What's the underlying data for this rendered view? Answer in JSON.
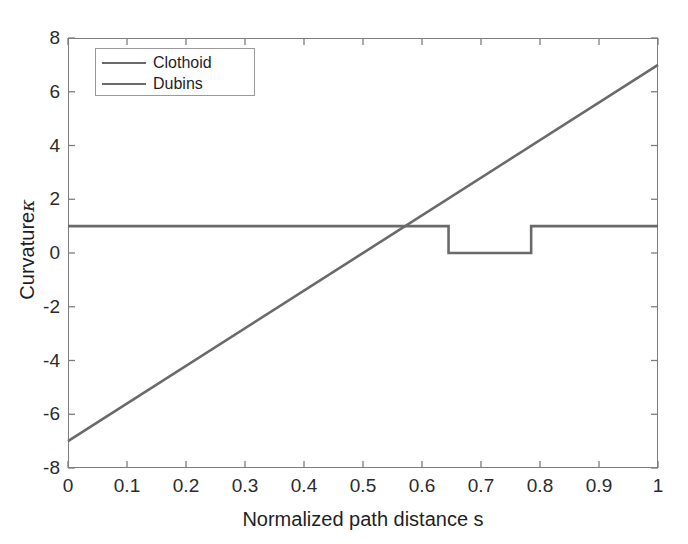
{
  "chart_data": {
    "type": "line",
    "title": "",
    "xlabel": "Normalized path distance s",
    "ylabel": "Curvature κ",
    "ylabel_text": "Curvature",
    "ylabel_symbol": "κ",
    "xlim": [
      0,
      1
    ],
    "ylim": [
      -8,
      8
    ],
    "xticks": [
      0,
      0.1,
      0.2,
      0.3,
      0.4,
      0.5,
      0.6,
      0.7,
      0.8,
      0.9,
      1
    ],
    "xticklabels": [
      "0",
      "0.1",
      "0.2",
      "0.3",
      "0.4",
      "0.5",
      "0.6",
      "0.7",
      "0.8",
      "0.9",
      "1"
    ],
    "yticks": [
      -8,
      -6,
      -4,
      -2,
      0,
      2,
      4,
      6,
      8
    ],
    "yticklabels": [
      "-8",
      "-6",
      "-4",
      "-2",
      "0",
      "2",
      "4",
      "6",
      "8"
    ],
    "grid": false,
    "legend_position": "upper left",
    "series": [
      {
        "name": "Clothoid",
        "color": "#6a6a6a",
        "linewidth": 2.6,
        "x": [
          0,
          1
        ],
        "values": [
          -7,
          7
        ]
      },
      {
        "name": "Dubins",
        "color": "#6a6a6a",
        "linewidth": 2.6,
        "x": [
          0,
          0.645,
          0.645,
          0.785,
          0.785,
          1
        ],
        "values": [
          1,
          1,
          0,
          0,
          1,
          1
        ]
      }
    ]
  },
  "legend": {
    "entries": [
      {
        "label": "Clothoid",
        "color": "#6a6a6a"
      },
      {
        "label": "Dubins",
        "color": "#6a6a6a"
      }
    ]
  },
  "axes": {
    "box_color": "#7d7d7d",
    "tick_color": "#7d7d7d",
    "text_color": "#1f1f1f"
  }
}
